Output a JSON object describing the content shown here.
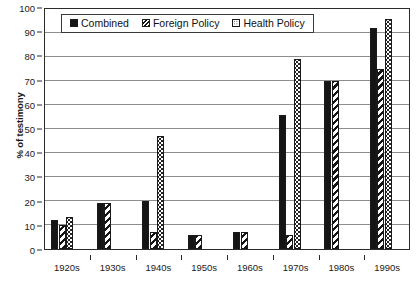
{
  "chart_data": {
    "type": "bar",
    "title": "",
    "xlabel": "",
    "ylabel": "% of testimony",
    "ylim": [
      0,
      100
    ],
    "ytick_step": 10,
    "yticks": [
      0,
      10,
      20,
      30,
      40,
      50,
      60,
      70,
      80,
      90,
      100
    ],
    "grid": true,
    "legend_position": "top-left-inside",
    "categories": [
      "1920s",
      "1930s",
      "1940s",
      "1950s",
      "1960s",
      "1970s",
      "1980s",
      "1990s"
    ],
    "series": [
      {
        "name": "Combined",
        "pattern": "solid-black",
        "color": "#151515",
        "values": [
          12,
          19,
          20,
          6,
          7,
          56,
          70,
          92
        ]
      },
      {
        "name": "Foreign Policy",
        "pattern": "diagonal-hatch",
        "color": "#151515",
        "values": [
          10,
          19,
          7,
          6,
          7,
          6,
          70,
          75
        ]
      },
      {
        "name": "Health Policy",
        "pattern": "dotted",
        "color": "#242424",
        "values": [
          13.5,
          null,
          47,
          null,
          null,
          79,
          null,
          96
        ]
      }
    ]
  },
  "legend": {
    "entries": [
      {
        "label": "Combined",
        "swatch": "combined"
      },
      {
        "label": "Foreign Policy",
        "swatch": "foreign"
      },
      {
        "label": "Health Policy",
        "swatch": "health"
      }
    ]
  },
  "axes": {
    "y_title": "% of testimony"
  },
  "colors": {
    "axis": "#2b2b2b",
    "gridline": "#8d8d8d",
    "text": "#1a1a1a",
    "background": "#ffffff"
  }
}
